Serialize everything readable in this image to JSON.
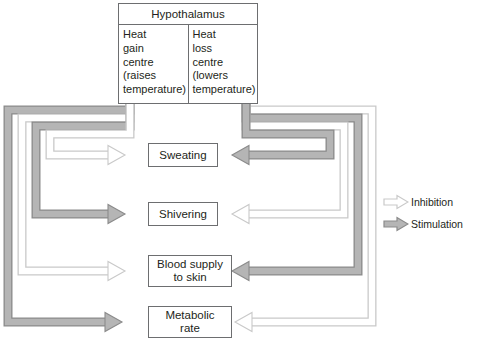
{
  "diagram": {
    "title_box": {
      "name": "Hypothalamus",
      "left_column": [
        "Heat",
        "gain",
        "centre",
        "(raises",
        "temperature)"
      ],
      "right_column": [
        "Heat",
        "loss",
        "centre",
        "(lowers",
        "temperature)"
      ]
    },
    "effectors": [
      {
        "id": "sweating",
        "label": "Sweating",
        "lines": [
          "Sweating"
        ],
        "left_arrow": "inhibition",
        "right_arrow": "stimulation"
      },
      {
        "id": "shivering",
        "label": "Shivering",
        "lines": [
          "Shivering"
        ],
        "left_arrow": "stimulation",
        "right_arrow": "inhibition"
      },
      {
        "id": "blood-supply",
        "label": "Blood supply to skin",
        "lines": [
          "Blood supply",
          "to skin"
        ],
        "left_arrow": "inhibition",
        "right_arrow": "stimulation"
      },
      {
        "id": "metabolic",
        "label": "Metabolic rate",
        "lines": [
          "Metabolic",
          "rate"
        ],
        "left_arrow": "stimulation",
        "right_arrow": "inhibition"
      }
    ],
    "legend": [
      {
        "key": "inhibition",
        "label": "Inhibition",
        "arrow": "inhibition"
      },
      {
        "key": "stimulation",
        "label": "Stimulation",
        "arrow": "stimulation"
      }
    ],
    "edge_caption": [
      "",
      "",
      ""
    ]
  },
  "colors": {
    "stimulation_fill": "#b5b5b5",
    "stimulation_stroke": "#8b8b8b",
    "inhibition_fill": "#ffffff",
    "inhibition_stroke": "#c9c9c9",
    "box_stroke": "#6d6e70",
    "text": "#231f20",
    "background": "#ffffff"
  }
}
